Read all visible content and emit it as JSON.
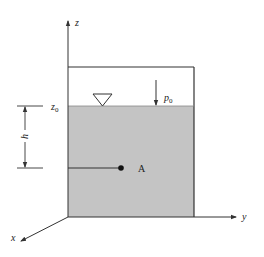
{
  "diagram": {
    "type": "hydrostatic-pressure-container",
    "axes": {
      "z_label": "z",
      "y_label": "y",
      "x_label": "x"
    },
    "labels": {
      "free_surface_elevation": "z",
      "free_surface_elevation_sub": "0",
      "surface_pressure": "p",
      "surface_pressure_sub": "0",
      "depth": "h",
      "point": "A"
    },
    "colors": {
      "fluid_fill": "#c4c4c4",
      "line": "#333333",
      "background": "#ffffff"
    }
  },
  "caption": ""
}
